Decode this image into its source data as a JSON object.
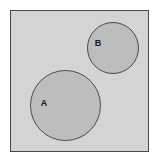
{
  "diagram": {
    "kind": "venn-diagram",
    "canvas": {
      "width": 159,
      "height": 164
    },
    "page_background": "#ffffff",
    "universe": {
      "name": "universal-set-rectangle",
      "x": 10,
      "y": 10,
      "width": 139,
      "height": 142,
      "fill": "#d4d4d4",
      "stroke": "#4a4a4a",
      "stroke_width": 1
    },
    "sets": [
      {
        "id": "A",
        "label": "A",
        "cx": 65.5,
        "cy": 105.5,
        "r": 35.5,
        "fill": "#bdbdbd",
        "stroke": "#4a4a4a",
        "stroke_width": 1,
        "label_x": 44,
        "label_y": 104
      },
      {
        "id": "B",
        "label": "B",
        "cx": 113,
        "cy": 48,
        "r": 26,
        "fill": "#bdbdbd",
        "stroke": "#4a4a4a",
        "stroke_width": 1,
        "label_x": 98,
        "label_y": 44
      }
    ]
  }
}
